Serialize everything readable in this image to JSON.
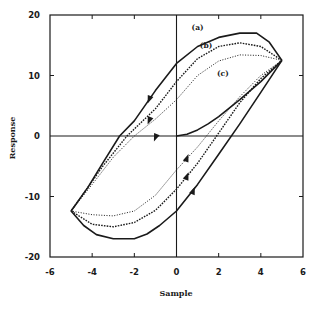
{
  "chart_data": {
    "type": "line",
    "title": "",
    "xlabel": "Sample",
    "ylabel": "Response",
    "xlim": [
      -6,
      6
    ],
    "ylim": [
      -20,
      20
    ],
    "xticks": [
      -6,
      -4,
      -2,
      0,
      2,
      4,
      6
    ],
    "yticks": [
      -20,
      -10,
      0,
      10,
      20
    ],
    "grid": false,
    "zero_lines": true,
    "legend": null,
    "annotations": [
      {
        "text": "(a)",
        "x": 1.0,
        "y": 17.5
      },
      {
        "text": "(b)",
        "x": 1.4,
        "y": 14.6
      },
      {
        "text": "(c)",
        "x": 2.2,
        "y": 10.0
      }
    ],
    "series": [
      {
        "name": "(a)",
        "style": "solid",
        "description": "outer hysteresis loop",
        "x": [
          5,
          4.4,
          3.8,
          3.0,
          2.0,
          1.0,
          0.0,
          -1.0,
          -2.0,
          -2.7,
          -3.5,
          -4.2,
          -5,
          -4.4,
          -3.8,
          -3.0,
          -2.0,
          -1.4,
          -0.8,
          0.0,
          1.0,
          2.0,
          3.0,
          4.0,
          5
        ],
        "y": [
          12.5,
          15.5,
          17.0,
          17.0,
          16.3,
          14.8,
          12.0,
          7.5,
          2.5,
          0.0,
          -4.5,
          -8.5,
          -12.4,
          -14.8,
          -16.3,
          -17.0,
          -17.0,
          -16.2,
          -14.8,
          -12.4,
          -8.0,
          -3.0,
          2.0,
          7.2,
          12.5
        ]
      },
      {
        "name": "(b)",
        "style": "dashed",
        "description": "middle hysteresis loop",
        "x": [
          5,
          4.0,
          3.0,
          2.0,
          1.0,
          0.0,
          -1.0,
          -2.35,
          -3.5,
          -4.3,
          -5,
          -4.0,
          -3.0,
          -2.0,
          -1.0,
          0.0,
          1.0,
          2.0,
          3.0,
          4.0,
          5
        ],
        "y": [
          12.5,
          14.8,
          15.4,
          14.8,
          12.8,
          9.0,
          4.5,
          0.0,
          -5.0,
          -9.0,
          -12.4,
          -14.6,
          -15.0,
          -14.3,
          -12.3,
          -8.8,
          -4.5,
          0.5,
          5.5,
          9.5,
          12.5
        ]
      },
      {
        "name": "(c)",
        "style": "dotted",
        "description": "inner hysteresis loop",
        "x": [
          5,
          4.0,
          3.0,
          2.0,
          1.0,
          0.0,
          -1.0,
          -2.0,
          -3.0,
          -4.0,
          -5,
          -4.0,
          -3.0,
          -2.0,
          -1.0,
          0.0,
          1.0,
          2.0,
          3.0,
          4.0,
          5
        ],
        "y": [
          12.5,
          13.3,
          13.4,
          12.4,
          10.0,
          6.0,
          2.8,
          0.0,
          -3.5,
          -8.0,
          -12.4,
          -13.0,
          -13.2,
          -12.4,
          -9.8,
          -5.6,
          -1.8,
          2.5,
          6.5,
          10.0,
          12.5
        ]
      },
      {
        "name": "initial",
        "style": "solid",
        "description": "initial (virgin) curve from origin to positive vertex",
        "x": [
          0,
          0.5,
          1.0,
          1.5,
          2.0,
          3.0,
          4.0,
          5
        ],
        "y": [
          0,
          0.3,
          1.0,
          2.0,
          3.2,
          6.0,
          9.0,
          12.5
        ]
      }
    ],
    "arrows": [
      {
        "series": "(a)",
        "x": -1.3,
        "y": 6.0,
        "direction": "down"
      },
      {
        "series": "(b)",
        "x": -1.3,
        "y": 2.5,
        "direction": "down"
      },
      {
        "series": "(c)",
        "x": -1.0,
        "y": -0.3,
        "direction": "down"
      },
      {
        "series": "(a)",
        "x": 0.8,
        "y": -9.0,
        "direction": "up"
      },
      {
        "series": "(b)",
        "x": 0.5,
        "y": -6.6,
        "direction": "up"
      },
      {
        "series": "(c)",
        "x": 0.5,
        "y": -3.6,
        "direction": "up"
      }
    ]
  }
}
